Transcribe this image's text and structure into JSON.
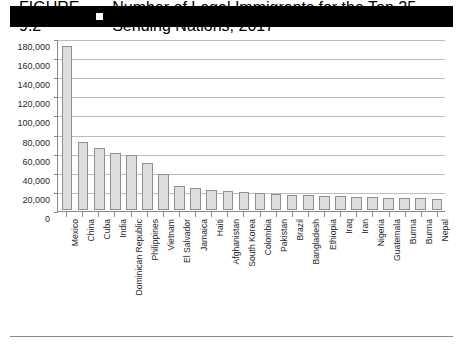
{
  "header": {
    "figure_label": "FIGURE 9.2",
    "marker_icon": "white-square-icon",
    "title": "Number of Legal Immigrants for the Top 25 Sending Nations, 2017"
  },
  "colors": {
    "header_background": "#000000",
    "header_text": "#ffffff",
    "bar_fill": "#dededc",
    "bar_border": "#8f8f8f",
    "gridline": "#bdbdbd",
    "axis": "#8a8a8a",
    "tick_text": "#2b2b2b"
  },
  "chart_data": {
    "type": "bar",
    "title": "Number of Legal Immigrants for the Top 25 Sending Nations, 2017",
    "xlabel": "",
    "ylabel": "",
    "ylim": [
      0,
      180000
    ],
    "ytick_values": [
      0,
      20000,
      40000,
      60000,
      80000,
      100000,
      120000,
      140000,
      160000,
      180000
    ],
    "ytick_labels": [
      "0",
      "20,000",
      "40,000",
      "60,000",
      "80,000",
      "100,000",
      "120,000",
      "140,000",
      "160,000",
      "180,000"
    ],
    "grid": true,
    "legend": false,
    "categories": [
      "Mexico",
      "China",
      "Cuba",
      "India",
      "Dominican Republic",
      "Philippines",
      "Vietnam",
      "El Salvador",
      "Jamaica",
      "Haiti",
      "Afghanistan",
      "South Korea",
      "Colombia",
      "Pakistan",
      "Brazil",
      "Bangladesh",
      "Ethiopia",
      "Iraq",
      "Iran",
      "Nigeria",
      "Guatemala",
      "Burma",
      "Burma",
      "Nepal"
    ],
    "values": [
      172000,
      71000,
      65000,
      60000,
      58000,
      49000,
      38000,
      25000,
      23000,
      21000,
      20000,
      19000,
      18000,
      17000,
      16000,
      15500,
      15000,
      14500,
      14000,
      13500,
      13000,
      13000,
      12500,
      12000
    ]
  }
}
